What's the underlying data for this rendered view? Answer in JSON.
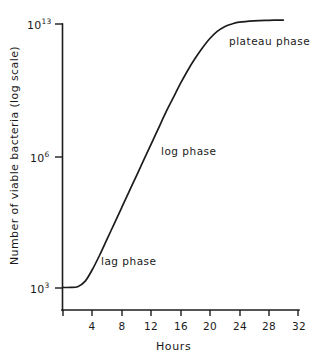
{
  "chart_data": {
    "type": "line",
    "title": "",
    "xlabel": "Hours",
    "ylabel": "Number of viable bacteria (log scale)",
    "yscale": "log",
    "xlim": [
      0,
      33
    ],
    "ylim": [
      3,
      13.4
    ],
    "grid": false,
    "legend": "none",
    "x_ticks": [
      "4",
      "8",
      "12",
      "16",
      "20",
      "24",
      "28",
      "32"
    ],
    "x_tick_values": [
      4,
      8,
      12,
      16,
      20,
      24,
      28,
      32
    ],
    "y_ticks": [
      "10³",
      "10⁶",
      "10¹³"
    ],
    "y_tick_bases": [
      "10",
      "10",
      "10"
    ],
    "y_tick_exponents": [
      "3",
      "6",
      "13"
    ],
    "y_tick_values": [
      1000,
      1000000,
      10000000000000
    ],
    "series": [
      {
        "name": "viable bacteria count",
        "x": [
          0,
          1,
          2,
          3,
          4,
          5,
          6,
          7,
          8,
          9,
          10,
          11,
          12,
          13,
          14,
          15,
          16,
          17,
          18,
          19,
          20,
          21,
          22,
          23,
          24,
          26,
          28,
          30
        ],
        "y_log10": [
          3.02,
          3.02,
          3.05,
          3.25,
          3.7,
          4.25,
          4.85,
          5.45,
          6.05,
          6.65,
          7.25,
          7.85,
          8.45,
          9.05,
          9.65,
          10.2,
          10.75,
          11.25,
          11.7,
          12.1,
          12.45,
          12.72,
          12.9,
          13.0,
          13.07,
          13.12,
          13.14,
          13.15
        ]
      }
    ],
    "annotations": [
      {
        "id": "lag-phase",
        "text": "lag phase",
        "x_hours": 7.5,
        "y_log10": 3.55
      },
      {
        "id": "log-phase",
        "text": "log phase",
        "x_hours": 14.5,
        "y_log10": 6.75
      },
      {
        "id": "plateau-phase",
        "text": "plateau phase",
        "x_hours": 26.0,
        "y_log10": 12.6
      }
    ],
    "colors": {
      "curve": "#1c1c1c",
      "axis": "#1c1c1c",
      "text": "#1a1a1a",
      "background": "#ffffff"
    }
  },
  "axes": {
    "x_title": "Hours",
    "y_title": "Number of viable bacteria  (log scale)",
    "x_tick_labels": [
      "4",
      "8",
      "12",
      "16",
      "20",
      "24",
      "28",
      "32"
    ],
    "y_tick_labels": [
      {
        "base": "10",
        "exponent": "13"
      },
      {
        "base": "10",
        "exponent": "6"
      },
      {
        "base": "10",
        "exponent": "3"
      }
    ]
  },
  "annotations": {
    "lag": "lag phase",
    "log": "log phase",
    "plateau": "plateau phase"
  }
}
